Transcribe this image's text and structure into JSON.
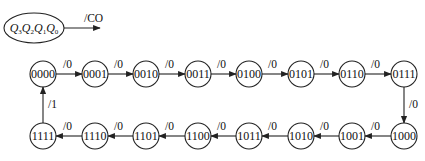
{
  "legend": {
    "state_vars": [
      {
        "name": "Q",
        "sub": "3"
      },
      {
        "name": "Q",
        "sub": "2"
      },
      {
        "name": "Q",
        "sub": "1"
      },
      {
        "name": "Q",
        "sub": "0"
      }
    ],
    "output_label": "/CO"
  },
  "states_top": [
    "0000",
    "0001",
    "0010",
    "0011",
    "0100",
    "0101",
    "0110",
    "0111"
  ],
  "states_bottom": [
    "1111",
    "1110",
    "1101",
    "1100",
    "1011",
    "1010",
    "1001",
    "1000"
  ],
  "transitions": {
    "top_labels": [
      "/0",
      "/0",
      "/0",
      "/0",
      "/0",
      "/0",
      "/0"
    ],
    "right_down_label": "/0",
    "bottom_labels": [
      "/0",
      "/0",
      "/0",
      "/0",
      "/0",
      "/0",
      "/0"
    ],
    "left_up_label": "/1"
  },
  "colors": {
    "stroke": "#222222",
    "text": "#111111",
    "background": "#ffffff"
  }
}
